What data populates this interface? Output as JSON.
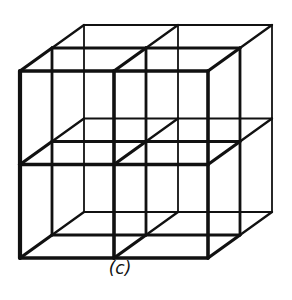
{
  "figure": {
    "caption": "(c)",
    "line_color": "#111111",
    "background": "#ffffff",
    "front_face": {
      "x0": 20,
      "y0": 71,
      "x1": 208,
      "y1": 258
    },
    "depth_offset": {
      "dx": 64,
      "dy": -46
    },
    "divisions": 2
  }
}
